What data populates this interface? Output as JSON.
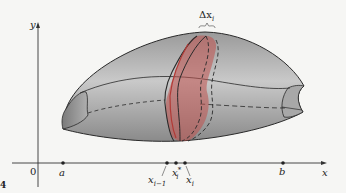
{
  "figure": {
    "axes": {
      "y_label": "y",
      "x_label": "x",
      "origin_label": "0"
    },
    "points": [
      {
        "id": "a",
        "label": "a",
        "x": 63
      },
      {
        "id": "x_im1",
        "label": "x",
        "sub": "i−1",
        "x": 167
      },
      {
        "id": "x_istar",
        "label": "x",
        "sub": "i",
        "sup": "*",
        "x": 176
      },
      {
        "id": "x_i",
        "label": "x",
        "sub": "i",
        "x": 185
      },
      {
        "id": "b",
        "label": "b",
        "x": 283
      }
    ],
    "delta_label": {
      "symbol": "Δx",
      "sub": "i"
    },
    "colors": {
      "solid_fill": "#8c8c8c",
      "solid_light": "#c4c4c4",
      "slice_fill": "#c0504d",
      "outline": "#2a2a2a",
      "axis": "#333333",
      "background": "#f6f6f4"
    },
    "edge_label": "4"
  }
}
